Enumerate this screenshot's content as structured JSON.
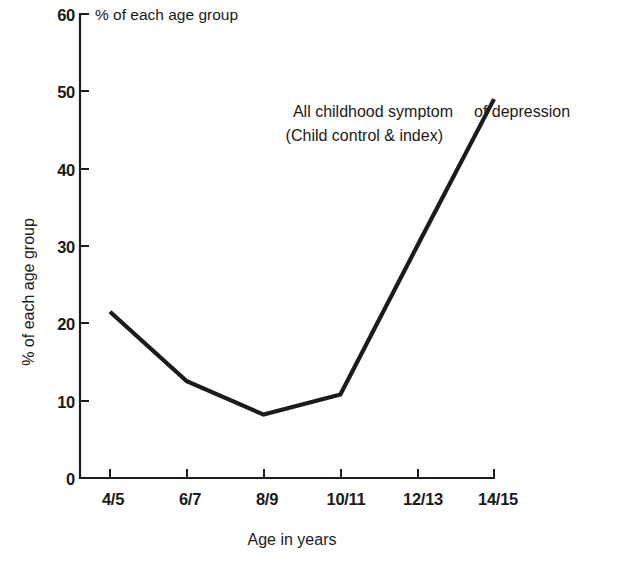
{
  "chart_data": {
    "type": "line",
    "title": "",
    "header_note": "% of each age group",
    "xlabel": "Age in years",
    "ylabel": "% of each age group",
    "categories": [
      "4/5",
      "6/7",
      "8/9",
      "10/11",
      "12/13",
      "14/15"
    ],
    "values": [
      21.5,
      12.5,
      8.2,
      10.8,
      30.0,
      49.0
    ],
    "series": [
      {
        "name": "All childhood symptom of depression (Child control & index)",
        "values": [
          21.5,
          12.5,
          8.2,
          10.8,
          30.0,
          49.0
        ]
      }
    ],
    "ylim": [
      0,
      60
    ],
    "yticks": [
      0,
      10,
      20,
      30,
      40,
      50,
      60
    ],
    "ytick_labels": [
      "0",
      "10",
      "20",
      "30",
      "40",
      "50",
      "60"
    ],
    "xtick_labels": [
      "4/5",
      "6/7",
      "8/9",
      "10/11",
      "12/13",
      "14/15"
    ],
    "grid": false,
    "legend": "none",
    "annotations": [
      {
        "id": "ann-line1-left",
        "text": "All childhood symptom"
      },
      {
        "id": "ann-line1-right",
        "text": "of depression"
      },
      {
        "id": "ann-line2-left",
        "text": "(Child control & index)"
      }
    ],
    "colors": {
      "line": "#1b1b1b",
      "axis": "#1d1d1d",
      "text": "#1a1a1a",
      "background": "#ffffff"
    }
  }
}
